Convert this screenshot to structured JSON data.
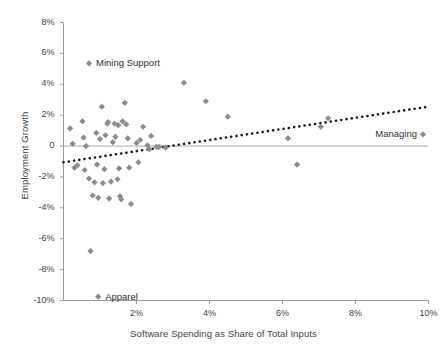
{
  "chart_data": {
    "type": "scatter",
    "title": "",
    "xlabel": "Software Spending as Share of Total Inputs",
    "ylabel": "Employment Growth",
    "xlim": [
      0,
      10
    ],
    "ylim": [
      -10,
      8
    ],
    "grid": false,
    "legend": "none",
    "xticks": [
      "2%",
      "4%",
      "6%",
      "8%",
      "10%"
    ],
    "xtick_values": [
      2,
      4,
      6,
      8,
      10
    ],
    "yticks": [
      "8%",
      "6%",
      "4%",
      "2%",
      "0",
      "-2%",
      "-4%",
      "-6%",
      "-8%",
      "-10%"
    ],
    "ytick_values": [
      8,
      6,
      4,
      2,
      0,
      -2,
      -4,
      -6,
      -8,
      -10
    ],
    "marker_color": "#8c8c8c",
    "axis_color": "#9a9a9a",
    "zero_line_color": "#a8a8a8",
    "trendline": {
      "style": "dotted",
      "color": "#1a1a1a",
      "x0": 0.0,
      "y0": -1.05,
      "x1": 10.0,
      "y1": 2.55
    },
    "points": [
      {
        "x": 0.18,
        "y": 1.15
      },
      {
        "x": 0.25,
        "y": 0.15
      },
      {
        "x": 0.3,
        "y": -1.4
      },
      {
        "x": 0.38,
        "y": -1.25
      },
      {
        "x": 0.52,
        "y": 1.6
      },
      {
        "x": 0.55,
        "y": 0.55
      },
      {
        "x": 0.58,
        "y": -1.55
      },
      {
        "x": 0.62,
        "y": 0.0
      },
      {
        "x": 0.7,
        "y": -2.1
      },
      {
        "x": 0.74,
        "y": -6.8
      },
      {
        "x": 0.8,
        "y": -3.2
      },
      {
        "x": 0.85,
        "y": -2.35
      },
      {
        "x": 0.9,
        "y": 0.85
      },
      {
        "x": 0.92,
        "y": -1.2
      },
      {
        "x": 0.95,
        "y": -3.35
      },
      {
        "x": 1.0,
        "y": 0.45
      },
      {
        "x": 1.05,
        "y": 2.55
      },
      {
        "x": 1.08,
        "y": -2.4
      },
      {
        "x": 1.12,
        "y": -1.5
      },
      {
        "x": 1.15,
        "y": 0.7
      },
      {
        "x": 1.2,
        "y": 1.45
      },
      {
        "x": 1.22,
        "y": 1.55
      },
      {
        "x": 1.25,
        "y": -3.4
      },
      {
        "x": 1.3,
        "y": -2.3
      },
      {
        "x": 1.35,
        "y": 0.25
      },
      {
        "x": 1.4,
        "y": 1.45
      },
      {
        "x": 1.42,
        "y": 0.6
      },
      {
        "x": 1.48,
        "y": -2.15
      },
      {
        "x": 1.5,
        "y": 1.35
      },
      {
        "x": 1.52,
        "y": -1.45
      },
      {
        "x": 1.55,
        "y": -3.25
      },
      {
        "x": 1.58,
        "y": -3.45
      },
      {
        "x": 1.62,
        "y": 1.6
      },
      {
        "x": 1.68,
        "y": 2.8
      },
      {
        "x": 1.72,
        "y": 1.4
      },
      {
        "x": 1.76,
        "y": 0.5
      },
      {
        "x": 1.8,
        "y": -1.4
      },
      {
        "x": 1.85,
        "y": -3.75
      },
      {
        "x": 2.0,
        "y": 0.2
      },
      {
        "x": 2.05,
        "y": -1.05
      },
      {
        "x": 2.1,
        "y": 0.4
      },
      {
        "x": 2.18,
        "y": 1.25
      },
      {
        "x": 2.3,
        "y": 0.05
      },
      {
        "x": 2.35,
        "y": -0.2
      },
      {
        "x": 2.4,
        "y": 0.65
      },
      {
        "x": 2.55,
        "y": -0.05
      },
      {
        "x": 2.62,
        "y": -0.05
      },
      {
        "x": 2.8,
        "y": -0.1
      },
      {
        "x": 3.3,
        "y": 4.1
      },
      {
        "x": 3.9,
        "y": 2.9
      },
      {
        "x": 4.5,
        "y": 1.9
      },
      {
        "x": 6.15,
        "y": 0.5
      },
      {
        "x": 6.4,
        "y": -1.2
      },
      {
        "x": 7.05,
        "y": 1.25
      },
      {
        "x": 7.25,
        "y": 1.8
      },
      {
        "x": 9.85,
        "y": 0.75
      },
      {
        "x": 0.7,
        "y": 5.35
      },
      {
        "x": 0.95,
        "y": -9.75
      }
    ],
    "annotations": [
      {
        "name": "mining-support",
        "text": "Mining Support",
        "x": 0.7,
        "y": 5.35
      },
      {
        "name": "apparel",
        "text": "Apparel",
        "x": 0.95,
        "y": -9.75
      },
      {
        "name": "managing",
        "text": "Managing",
        "x": 9.85,
        "y": 0.75
      }
    ]
  }
}
